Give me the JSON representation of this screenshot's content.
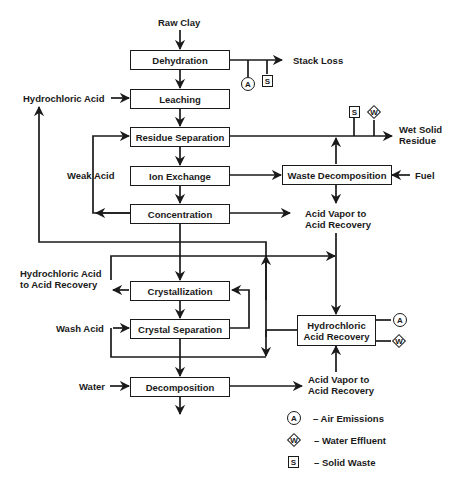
{
  "diagram": {
    "type": "process-flow",
    "inputs": {
      "raw_clay": "Raw Clay",
      "hydrochloric_acid": "Hydrochloric Acid",
      "fuel": "Fuel",
      "wash_acid": "Wash Acid",
      "water": "Water"
    },
    "process_steps": {
      "dehydration": "Dehydration",
      "leaching": "Leaching",
      "residue_separation": "Residue Separation",
      "ion_exchange": "Ion Exchange",
      "concentration": "Concentration",
      "waste_decomposition": "Waste Decomposition",
      "crystallization": "Crystallization",
      "crystal_separation": "Crystal Separation",
      "hcl_recovery_line1": "Hydrochloric",
      "hcl_recovery_line2": "Acid Recovery",
      "decomposition": "Decomposition"
    },
    "streams": {
      "stack_loss": "Stack Loss",
      "wet_solid_residue_line1": "Wet Solid",
      "wet_solid_residue_line2": "Residue",
      "weak_acid": "Weak Acid",
      "acid_vapor_1_line1": "Acid Vapor to",
      "acid_vapor_1_line2": "Acid Recovery",
      "hcl_to_recovery_line1": "Hydrochloric Acid",
      "hcl_to_recovery_line2": "to Acid Recovery",
      "acid_vapor_2_line1": "Acid Vapor to",
      "acid_vapor_2_line2": "Acid Recovery"
    },
    "emission_symbols": {
      "air": "A",
      "water": "W",
      "solid": "S"
    },
    "legend": {
      "items": [
        {
          "symbol": "A",
          "shape": "circle",
          "label": "– Air Emissions"
        },
        {
          "symbol": "W",
          "shape": "diamond",
          "label": "– Water Effluent"
        },
        {
          "symbol": "S",
          "shape": "square",
          "label": "– Solid Waste"
        }
      ]
    },
    "colors": {
      "line": "#1a1a1a",
      "background": "#ffffff"
    }
  }
}
